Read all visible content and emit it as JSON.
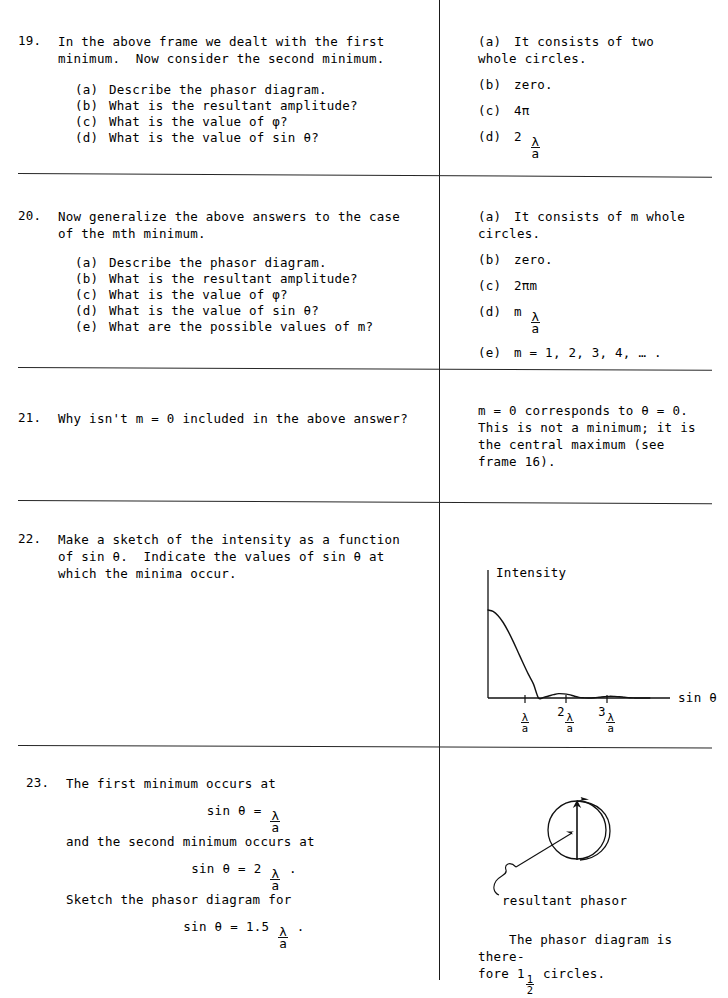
{
  "layout": {
    "divider_x": 439,
    "rule_y": [
      173,
      367,
      500,
      745
    ],
    "ink_color": "#111111"
  },
  "frames": [
    {
      "number": "19.",
      "question_lines": "In the above frame we dealt with the first\nminimum.  Now consider the second minimum.",
      "sub_questions": [
        {
          "label": "(a)",
          "text": "Describe the phasor diagram."
        },
        {
          "label": "(b)",
          "text": "What is the resultant amplitude?"
        },
        {
          "label": "(c)",
          "text": "What is the value of φ?"
        },
        {
          "label": "(d)",
          "text": "What is the value of sin θ?"
        }
      ],
      "answers": [
        {
          "label": "(a)",
          "text": "It consists of two\nwhole circles."
        },
        {
          "label": "(b)",
          "text": "zero."
        },
        {
          "label": "(c)",
          "text": "4π"
        },
        {
          "label": "(d)",
          "prefix": "2",
          "fraction": {
            "num": "λ",
            "den": "a"
          }
        }
      ]
    },
    {
      "number": "20.",
      "question_lines": "Now generalize the above answers to the case\nof the mth minimum.",
      "sub_questions": [
        {
          "label": "(a)",
          "text": "Describe the phasor diagram."
        },
        {
          "label": "(b)",
          "text": "What is the resultant amplitude?"
        },
        {
          "label": "(c)",
          "text": "What is the value of φ?"
        },
        {
          "label": "(d)",
          "text": "What is the value of sin θ?"
        },
        {
          "label": "(e)",
          "text": "What are the possible values of m?"
        }
      ],
      "answers": [
        {
          "label": "(a)",
          "text": "It consists of m whole\ncircles."
        },
        {
          "label": "(b)",
          "text": "zero."
        },
        {
          "label": "(c)",
          "text": "2πm"
        },
        {
          "label": "(d)",
          "prefix": "m",
          "fraction": {
            "num": "λ",
            "den": "a"
          }
        },
        {
          "label": "(e)",
          "text": "m = 1, 2, 3, 4, … ."
        }
      ]
    },
    {
      "number": "21.",
      "question_lines": "Why isn't m = 0 included in the above answer?",
      "answer_text": "m = 0 corresponds to θ = 0.\nThis is not a minimum; it is\nthe central maximum (see\nframe 16)."
    },
    {
      "number": "22.",
      "question_lines": "Make a sketch of the intensity as a function\nof sin θ.  Indicate the values of sin θ at\nwhich the minima occur."
    },
    {
      "number": "23.",
      "line1": "The first minimum occurs at",
      "eq1": {
        "lhs": "sin θ = ",
        "fraction": {
          "num": "λ",
          "den": "a"
        },
        "suffix": ""
      },
      "line2": "and the second minimum occurs at",
      "eq2": {
        "lhs": "sin θ = 2 ",
        "fraction": {
          "num": "λ",
          "den": "a"
        },
        "suffix": " ."
      },
      "line3": "Sketch the phasor diagram for",
      "eq3": {
        "lhs": "sin θ = 1.5 ",
        "fraction": {
          "num": "λ",
          "den": "a"
        },
        "suffix": " ."
      },
      "phasor_label": "resultant phasor",
      "closing_prefix": "The phasor diagram is there-\nfore 1",
      "closing_fraction": {
        "num": "1",
        "den": "2"
      },
      "closing_suffix": " circles."
    }
  ],
  "chart_data": {
    "type": "line",
    "title": "",
    "ylabel": "Intensity",
    "xlabel": "sin θ",
    "tick_labels": [
      {
        "prefix": "",
        "num": "λ",
        "den": "a"
      },
      {
        "prefix": "2",
        "num": "λ",
        "den": "a"
      },
      {
        "prefix": "3",
        "num": "λ",
        "den": "a"
      }
    ],
    "minima_at": [
      1,
      2,
      3
    ],
    "x": [
      0.0,
      0.1,
      0.2,
      0.3,
      0.4,
      0.5,
      0.6,
      0.7,
      0.8,
      0.9,
      1.0,
      1.1,
      1.2,
      1.3,
      1.4,
      1.5,
      1.6,
      1.7,
      1.8,
      1.9,
      2.0,
      2.1,
      2.2,
      2.3,
      2.4,
      2.5,
      2.6,
      2.7,
      2.8,
      2.9,
      3.0,
      3.2
    ],
    "y": [
      1.0,
      0.984,
      0.935,
      0.858,
      0.757,
      0.641,
      0.515,
      0.389,
      0.268,
      0.158,
      0.0,
      0.0069,
      0.0225,
      0.0387,
      0.0495,
      0.0472,
      0.0387,
      0.0225,
      0.0069,
      0.0017,
      0.0,
      0.0027,
      0.0087,
      0.0149,
      0.019,
      0.018,
      0.0149,
      0.0087,
      0.0027,
      0.0007,
      0.0,
      0.0
    ],
    "axis_ranges": {
      "x": [
        0,
        3.6
      ],
      "y": [
        0,
        1.0
      ]
    },
    "grid": false,
    "legend": "none"
  }
}
